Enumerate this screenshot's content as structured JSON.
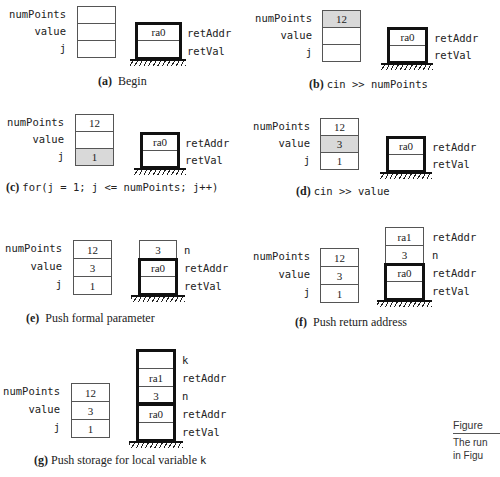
{
  "figure": {
    "side_title": "Figure",
    "side_text_lines": [
      "The run",
      "in Figu"
    ]
  },
  "panels": [
    {
      "id": "a",
      "caption_label": "(a)",
      "caption_text": "Begin",
      "caption_mono": false,
      "globals": [
        {
          "name": "numPoints",
          "value": "",
          "highlight": false
        },
        {
          "name": "value",
          "value": "",
          "highlight": false
        },
        {
          "name": "j",
          "value": "",
          "highlight": false
        }
      ],
      "stack": [
        {
          "name": "retAddr",
          "value": "ra0"
        },
        {
          "name": "retVal",
          "value": ""
        }
      ]
    },
    {
      "id": "b",
      "caption_label": "(b)",
      "caption_text": "cin >> numPoints",
      "caption_mono": true,
      "globals": [
        {
          "name": "numPoints",
          "value": "12",
          "highlight": true
        },
        {
          "name": "value",
          "value": "",
          "highlight": false
        },
        {
          "name": "j",
          "value": "",
          "highlight": false
        }
      ],
      "stack": [
        {
          "name": "retAddr",
          "value": "ra0"
        },
        {
          "name": "retVal",
          "value": ""
        }
      ]
    },
    {
      "id": "c",
      "caption_label": "(c)",
      "caption_text": "for(j = 1; j <= numPoints; j++)",
      "caption_mono": true,
      "globals": [
        {
          "name": "numPoints",
          "value": "12",
          "highlight": false
        },
        {
          "name": "value",
          "value": "",
          "highlight": false
        },
        {
          "name": "j",
          "value": "1",
          "highlight": true
        }
      ],
      "stack": [
        {
          "name": "retAddr",
          "value": "ra0"
        },
        {
          "name": "retVal",
          "value": ""
        }
      ]
    },
    {
      "id": "d",
      "caption_label": "(d)",
      "caption_text": "cin >> value",
      "caption_mono": true,
      "globals": [
        {
          "name": "numPoints",
          "value": "12",
          "highlight": false
        },
        {
          "name": "value",
          "value": "3",
          "highlight": true
        },
        {
          "name": "j",
          "value": "1",
          "highlight": false
        }
      ],
      "stack": [
        {
          "name": "retAddr",
          "value": "ra0"
        },
        {
          "name": "retVal",
          "value": ""
        }
      ]
    },
    {
      "id": "e",
      "caption_label": "(e)",
      "caption_text": "Push formal parameter",
      "caption_mono": false,
      "globals": [
        {
          "name": "numPoints",
          "value": "12",
          "highlight": false
        },
        {
          "name": "value",
          "value": "3",
          "highlight": false
        },
        {
          "name": "j",
          "value": "1",
          "highlight": false
        }
      ],
      "stack": [
        {
          "name": "n",
          "value": "3"
        },
        {
          "name": "retAddr",
          "value": "ra0"
        },
        {
          "name": "retVal",
          "value": ""
        }
      ]
    },
    {
      "id": "f",
      "caption_label": "(f)",
      "caption_text": "Push return address",
      "caption_mono": false,
      "globals": [
        {
          "name": "numPoints",
          "value": "12",
          "highlight": false
        },
        {
          "name": "value",
          "value": "3",
          "highlight": false
        },
        {
          "name": "j",
          "value": "1",
          "highlight": false
        }
      ],
      "stack": [
        {
          "name": "retAddr",
          "value": "ra1"
        },
        {
          "name": "n",
          "value": "3"
        },
        {
          "name": "retAddr",
          "value": "ra0"
        },
        {
          "name": "retVal",
          "value": ""
        }
      ]
    },
    {
      "id": "g",
      "caption_label": "(g)",
      "caption_text": "Push storage for local variable",
      "caption_mono_suffix": "k",
      "caption_mono": false,
      "globals": [
        {
          "name": "numPoints",
          "value": "12",
          "highlight": false
        },
        {
          "name": "value",
          "value": "3",
          "highlight": false
        },
        {
          "name": "j",
          "value": "1",
          "highlight": false
        }
      ],
      "stack": [
        {
          "name": "k",
          "value": ""
        },
        {
          "name": "retAddr",
          "value": "ra1"
        },
        {
          "name": "n",
          "value": "3"
        },
        {
          "name": "retAddr",
          "value": "ra0"
        },
        {
          "name": "retVal",
          "value": ""
        }
      ]
    }
  ]
}
